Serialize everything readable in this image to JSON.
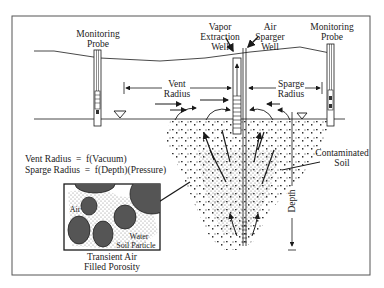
{
  "diagram": {
    "labels": {
      "monitoring_probe_left": [
        "Monitoring",
        "Probe"
      ],
      "vapor_extraction_well": [
        "Vapor",
        "Extraction",
        "Well"
      ],
      "air_sparger_well": [
        "Air",
        "Sparger",
        "Well"
      ],
      "monitoring_probe_right": [
        "Monitoring",
        "Probe"
      ],
      "vent_radius": [
        "Vent",
        "Radius"
      ],
      "sparge_radius": [
        "Sparge",
        "Radius"
      ],
      "contaminated_soil": [
        "Contaminated",
        "Soil"
      ],
      "depth": "Depth",
      "equation_vent": "Vent Radius  =  f(Vacuum)",
      "equation_sparge": "Sparge Radius  =  f(Depth)(Pressure)",
      "inset_air": "Air",
      "inset_water": "Water",
      "inset_soil_particle": "Soil Particle",
      "inset_caption": [
        "Transient Air",
        "Filled Porosity"
      ]
    },
    "icons": {
      "water_table": "inverted-triangle-water-table-icon"
    },
    "colors": {
      "line": "#1a1a1a",
      "frame": "#555555",
      "particle": "#4a4a4a",
      "stipple": "#777777",
      "background": "#ffffff"
    }
  }
}
